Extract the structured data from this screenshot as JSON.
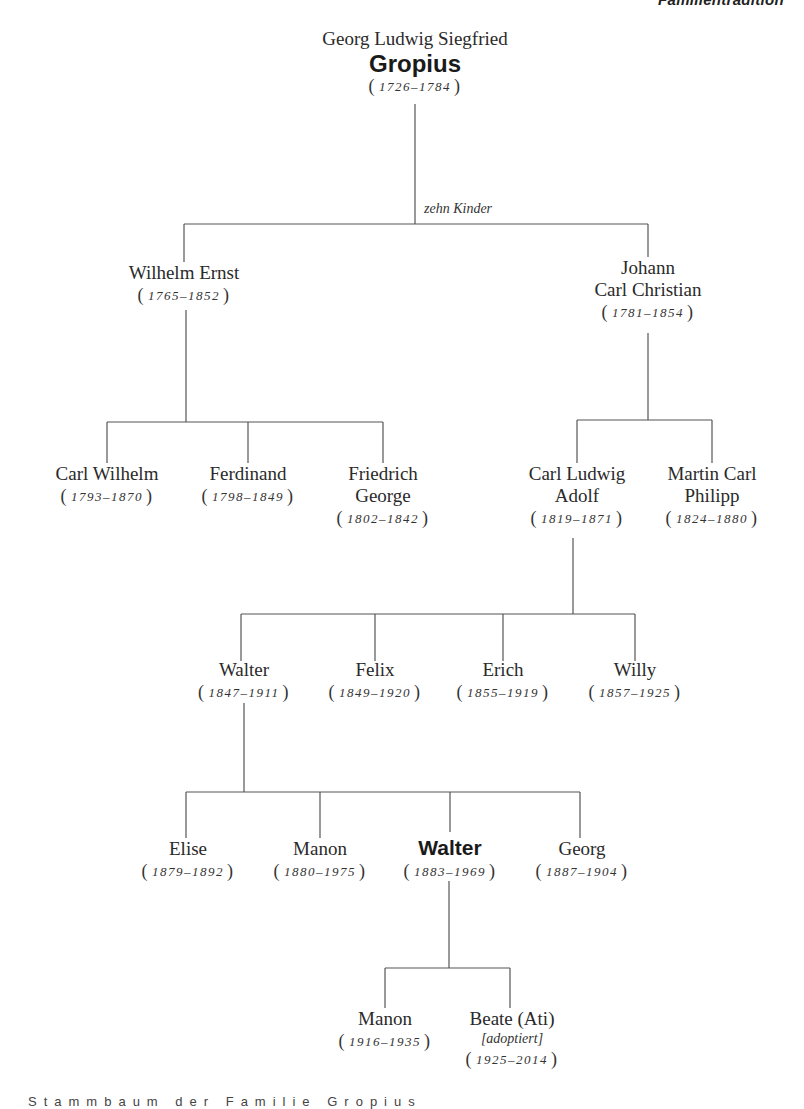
{
  "page": {
    "header_cropped_text": "Familientradition",
    "footer_cropped_text": "Stammbaum der Familie Gropius"
  },
  "tree": {
    "line_color": "#555555",
    "root": {
      "given_names": "Georg Ludwig Siegfried",
      "surname": "Gropius",
      "dates": "1726–1784",
      "children_note": "zehn Kinder"
    },
    "gen1": [
      {
        "name_lines": [
          "Wilhelm Ernst"
        ],
        "dates": "1765–1852"
      },
      {
        "name_lines": [
          "Johann",
          "Carl Christian"
        ],
        "dates": "1781–1854"
      }
    ],
    "gen2_wilhelm": [
      {
        "name_lines": [
          "Carl Wilhelm"
        ],
        "dates": "1793–1870"
      },
      {
        "name_lines": [
          "Ferdinand"
        ],
        "dates": "1798–1849"
      },
      {
        "name_lines": [
          "Friedrich",
          "George"
        ],
        "dates": "1802–1842"
      }
    ],
    "gen2_johann": [
      {
        "name_lines": [
          "Carl Ludwig",
          "Adolf"
        ],
        "dates": "1819–1871"
      },
      {
        "name_lines": [
          "Martin Carl",
          "Philipp"
        ],
        "dates": "1824–1880"
      }
    ],
    "gen3": [
      {
        "name": "Walter",
        "dates": "1847–1911"
      },
      {
        "name": "Felix",
        "dates": "1849–1920"
      },
      {
        "name": "Erich",
        "dates": "1855–1919"
      },
      {
        "name": "Willy",
        "dates": "1857–1925"
      }
    ],
    "gen4": [
      {
        "name": "Elise",
        "dates": "1879–1892",
        "bold": false
      },
      {
        "name": "Manon",
        "dates": "1880–1975",
        "bold": false
      },
      {
        "name": "Walter",
        "dates": "1883–1969",
        "bold": true
      },
      {
        "name": "Georg",
        "dates": "1887–1904",
        "bold": false
      }
    ],
    "gen5": [
      {
        "name": "Manon",
        "dates": "1916–1935"
      },
      {
        "name": "Beate (Ati)",
        "note": "[adoptiert]",
        "dates": "1925–2014"
      }
    ]
  }
}
